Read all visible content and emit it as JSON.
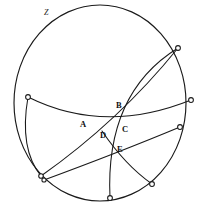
{
  "figure": {
    "name": "hyperbolic-disk-geodesic-diagram",
    "stroke_color": "#1a1a1a",
    "background_color": "#ffffff",
    "width": 202,
    "height": 207
  },
  "boundary": {
    "label": "Z",
    "label_x": 44,
    "label_y": 9,
    "center_x": 100,
    "center_y": 103,
    "radius_x": 86,
    "radius_y": 98
  },
  "boundary_nodes": [
    {
      "id": "n-left",
      "x": 28,
      "y": 97,
      "radius": 2.3
    },
    {
      "id": "n-top-right",
      "x": 178,
      "y": 48,
      "radius": 2.3
    },
    {
      "id": "n-right-upper",
      "x": 191,
      "y": 100,
      "radius": 2.3
    },
    {
      "id": "n-right-lower",
      "x": 180,
      "y": 127,
      "radius": 2.3
    },
    {
      "id": "n-bottom-left",
      "x": 41,
      "y": 176,
      "radius": 2.3
    },
    {
      "id": "n-bottom-left2",
      "x": 44,
      "y": 180,
      "radius": 2.1
    },
    {
      "id": "n-bottom",
      "x": 110,
      "y": 198,
      "radius": 2.3
    },
    {
      "id": "n-bottom-right",
      "x": 152,
      "y": 184,
      "radius": 2.3
    }
  ],
  "arcs": [
    {
      "id": "arc-left-to-right-upper",
      "from": "n-left",
      "to": "n-right-upper",
      "path": "M 28 97 Q 104 135 191 100"
    },
    {
      "id": "arc-left-to-bottom-left",
      "from": "n-left",
      "to": "n-bottom-left",
      "path": "M 28 97 Q 20 148 41 176"
    },
    {
      "id": "arc-topright-to-bottom",
      "from": "n-top-right",
      "to": "n-bottom",
      "path": "M 178 48 Q 106 94 110 198"
    },
    {
      "id": "arc-bottomleft-to-rightlower",
      "from": "n-bottom-left2",
      "to": "n-right-lower",
      "path": "M 44 180 Q 118 151 180 127"
    },
    {
      "id": "arc-bottomleft-to-topright-inner",
      "from": "n-bottom-left",
      "to": "n-top-right",
      "path": "M 41 176 Q 118 120 178 48"
    },
    {
      "id": "arc-bottomright-to-d",
      "from": "n-bottom-right",
      "to": "intersection-d",
      "path": "M 152 184 Q 124 164 102 132"
    }
  ],
  "intersections": [
    {
      "id": "point-a",
      "label": "A",
      "label_x": 80,
      "label_y": 120,
      "x": 90,
      "y": 125
    },
    {
      "id": "point-b",
      "label": "B",
      "label_x": 116,
      "label_y": 101,
      "x": 120,
      "y": 110
    },
    {
      "id": "point-c",
      "label": "C",
      "label_x": 122,
      "label_y": 125,
      "x": 119,
      "y": 122
    },
    {
      "id": "point-d",
      "label": "D",
      "label_x": 100,
      "label_y": 131,
      "x": 102,
      "y": 132
    },
    {
      "id": "point-e",
      "label": "E",
      "label_x": 117,
      "label_y": 145,
      "x": 113,
      "y": 143
    }
  ]
}
